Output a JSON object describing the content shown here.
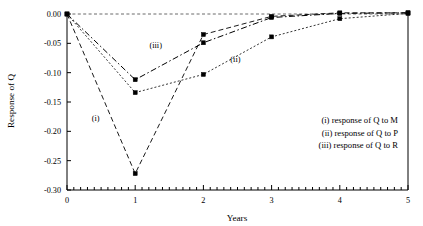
{
  "chart_data": {
    "type": "line",
    "title": "",
    "xlabel": "Years",
    "ylabel": "Response of Q",
    "x": [
      0,
      1,
      2,
      3,
      4,
      5
    ],
    "xlim": [
      0,
      5
    ],
    "ylim": [
      -0.3,
      0.005
    ],
    "grid": false,
    "zero_reference_line": true,
    "xticks": [
      "0",
      "1",
      "2",
      "3",
      "4",
      "5"
    ],
    "yticks": [
      "0.00",
      "-0.05",
      "-0.10",
      "-0.15",
      "-0.20",
      "-0.25",
      "-0.30"
    ],
    "ytick_values": [
      0.0,
      -0.05,
      -0.1,
      -0.15,
      -0.2,
      -0.25,
      -0.3
    ],
    "xtick_minor_per_interval": 10,
    "markers": "filled-square",
    "legend_position": "inside-right",
    "series": [
      {
        "key": "i",
        "name": "(i) response of Q to M",
        "label": "(i)",
        "values": [
          0.0,
          -0.272,
          -0.035,
          -0.004,
          0.002,
          0.002
        ],
        "dash": "5 3",
        "width": 0.9
      },
      {
        "key": "ii",
        "name": "(ii) response of Q to P",
        "label": "(ii)",
        "values": [
          0.0,
          -0.134,
          -0.103,
          -0.039,
          -0.008,
          0.001
        ],
        "dash": "2 2",
        "width": 0.8
      },
      {
        "key": "iii",
        "name": "(iii) response of Q to R",
        "label": "(iii)",
        "values": [
          0.0,
          -0.112,
          -0.049,
          -0.006,
          0.001,
          0.002
        ],
        "dash": "6 2.5 1.5 2.5",
        "width": 1.0
      }
    ],
    "curve_annotations": [
      {
        "text": "(i)",
        "x": 0.42,
        "y": -0.182
      },
      {
        "text": "(iii)",
        "x": 1.3,
        "y": -0.058
      },
      {
        "text": "(ii)",
        "x": 2.47,
        "y": -0.082
      }
    ],
    "legend_entries": [
      "(i) response of Q to M",
      "(ii) response of Q to P",
      "(iii) response of Q to R"
    ],
    "colors": {
      "axis": "#000000",
      "series": "#000000",
      "marker": "#000000",
      "zero_line": "#444444",
      "background": "#ffffff"
    }
  }
}
